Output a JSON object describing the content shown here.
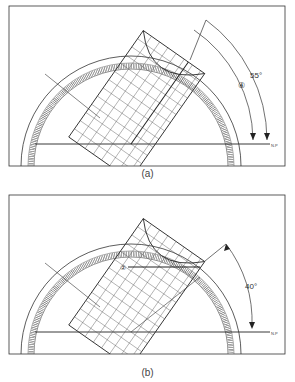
{
  "figure": {
    "panels": [
      {
        "id": "a",
        "caption": "(a)",
        "angle_label": "55°",
        "step_marker": "④",
        "horizon_mark": "N.P",
        "grid_angle_deg": 55
      },
      {
        "id": "b",
        "caption": "(b)",
        "angle_label": "40°",
        "step_marker": "②",
        "horizon_mark": "N.P",
        "grid_angle_deg": 40
      }
    ],
    "colors": {
      "line": "#2a2a2a",
      "light_line": "#6a6a6a",
      "background": "#ffffff"
    }
  }
}
